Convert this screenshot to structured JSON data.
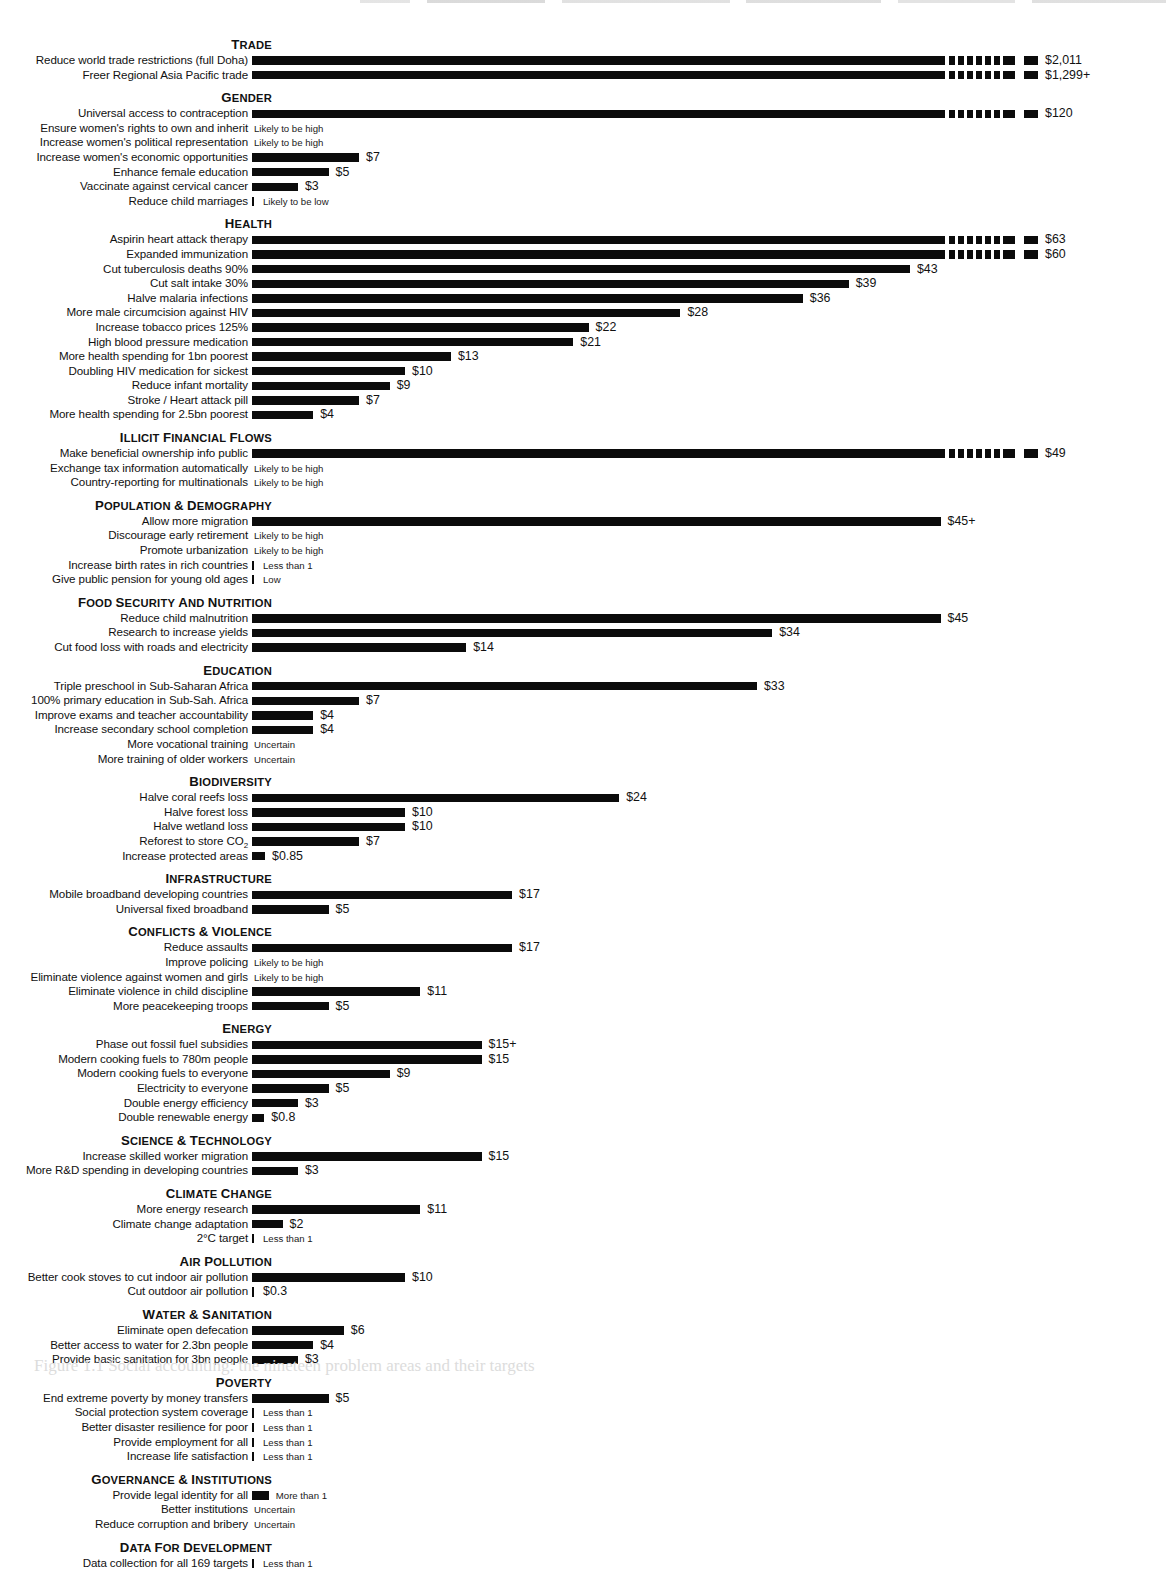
{
  "figure": {
    "caption": "Figure 1.1 Social accounting: the nineteen problem areas and their targets",
    "units_note": "Benefit per dollar spent",
    "axis_origin_px": 252,
    "px_per_dollar": 15.3
  },
  "chart_data": {
    "type": "bar",
    "title": "",
    "xlabel": "",
    "ylabel": "",
    "orientation": "horizontal",
    "grid": false,
    "legend": false,
    "xlim": [
      0,
      55
    ],
    "value_prefix": "$",
    "note_values": [
      "Likely to be high",
      "Likely to be low",
      "Less than 1",
      "More than 1",
      "Low",
      "Uncertain"
    ],
    "sections": [
      {
        "name": "Trade",
        "items": [
          {
            "label": "Reduce world trade restrictions (full Doha)",
            "value": 2011,
            "display": "$2,011",
            "truncated": true
          },
          {
            "label": "Freer Regional Asia Pacific trade",
            "value": 1299,
            "display": "$1,299+",
            "truncated": true
          }
        ]
      },
      {
        "name": "Gender",
        "items": [
          {
            "label": "Universal access to contraception",
            "value": 120,
            "display": "$120",
            "truncated": true
          },
          {
            "label": "Ensure women's rights to own and inherit",
            "value": null,
            "note": "Likely to be high"
          },
          {
            "label": "Increase women's political representation",
            "value": null,
            "note": "Likely to be high"
          },
          {
            "label": "Increase women's economic opportunities",
            "value": 7,
            "display": "$7"
          },
          {
            "label": "Enhance female education",
            "value": 5,
            "display": "$5"
          },
          {
            "label": "Vaccinate against cervical cancer",
            "value": 3,
            "display": "$3"
          },
          {
            "label": "Reduce child marriages",
            "value": 0,
            "note": "Likely to be low",
            "tick": true
          }
        ]
      },
      {
        "name": "Health",
        "items": [
          {
            "label": "Aspirin heart attack therapy",
            "value": 63,
            "display": "$63",
            "truncated": true
          },
          {
            "label": "Expanded immunization",
            "value": 60,
            "display": "$60",
            "truncated": true
          },
          {
            "label": "Cut tuberculosis deaths 90%",
            "value": 43,
            "display": "$43"
          },
          {
            "label": "Cut salt intake 30%",
            "value": 39,
            "display": "$39"
          },
          {
            "label": "Halve malaria infections",
            "value": 36,
            "display": "$36"
          },
          {
            "label": "More male circumcision against HIV",
            "value": 28,
            "display": "$28"
          },
          {
            "label": "Increase tobacco prices 125%",
            "value": 22,
            "display": "$22"
          },
          {
            "label": "High blood pressure medication",
            "value": 21,
            "display": "$21"
          },
          {
            "label": "More health spending for 1bn poorest",
            "value": 13,
            "display": "$13"
          },
          {
            "label": "Doubling HIV medication for sickest",
            "value": 10,
            "display": "$10"
          },
          {
            "label": "Reduce infant mortality",
            "value": 9,
            "display": "$9"
          },
          {
            "label": "Stroke / Heart attack pill",
            "value": 7,
            "display": "$7"
          },
          {
            "label": "More health spending for 2.5bn poorest",
            "value": 4,
            "display": "$4"
          }
        ]
      },
      {
        "name": "Illicit financial flows",
        "items": [
          {
            "label": "Make beneficial ownership info public",
            "value": 49,
            "display": "$49"
          },
          {
            "label": "Exchange tax information automatically",
            "value": null,
            "note": "Likely to be high"
          },
          {
            "label": "Country-reporting for multinationals",
            "value": null,
            "note": "Likely to be high"
          }
        ]
      },
      {
        "name": "Population & Demography",
        "items": [
          {
            "label": "Allow more migration",
            "value": 45,
            "display": "$45+"
          },
          {
            "label": "Discourage early retirement",
            "value": null,
            "note": "Likely to be high"
          },
          {
            "label": "Promote urbanization",
            "value": null,
            "note": "Likely to be high"
          },
          {
            "label": "Increase birth rates in rich countries",
            "value": 0,
            "note": "Less than 1",
            "tick": true
          },
          {
            "label": "Give public pension for young old ages",
            "value": 0,
            "note": "Low",
            "tick": true
          }
        ]
      },
      {
        "name": "Food Security and Nutrition",
        "items": [
          {
            "label": "Reduce child malnutrition",
            "value": 45,
            "display": "$45"
          },
          {
            "label": "Research to increase yields",
            "value": 34,
            "display": "$34"
          },
          {
            "label": "Cut food loss with roads and electricity",
            "value": 14,
            "display": "$14"
          }
        ]
      },
      {
        "name": "Education",
        "items": [
          {
            "label": "Triple preschool in Sub-Saharan Africa",
            "value": 33,
            "display": "$33"
          },
          {
            "label": "100% primary education in Sub-Sah. Africa",
            "value": 7,
            "display": "$7"
          },
          {
            "label": "Improve exams and teacher accountability",
            "value": 4,
            "display": "$4"
          },
          {
            "label": "Increase secondary school completion",
            "value": 4,
            "display": "$4"
          },
          {
            "label": "More vocational training",
            "value": null,
            "note": "Uncertain"
          },
          {
            "label": "More training of older workers",
            "value": null,
            "note": "Uncertain"
          }
        ]
      },
      {
        "name": "Biodiversity",
        "items": [
          {
            "label": "Halve coral reefs loss",
            "value": 24,
            "display": "$24"
          },
          {
            "label": "Halve forest loss",
            "value": 10,
            "display": "$10"
          },
          {
            "label": "Halve wetland loss",
            "value": 10,
            "display": "$10"
          },
          {
            "label": "Reforest to store CO2",
            "label_html": "Reforest to store CO<sub>2</sub>",
            "value": 7,
            "display": "$7"
          },
          {
            "label": "Increase protected areas",
            "value": 0.85,
            "display": "$0.85"
          }
        ]
      },
      {
        "name": "Infrastructure",
        "items": [
          {
            "label": "Mobile broadband developing countries",
            "value": 17,
            "display": "$17"
          },
          {
            "label": "Universal fixed broadband",
            "value": 5,
            "display": "$5"
          }
        ]
      },
      {
        "name": "Conflicts & Violence",
        "items": [
          {
            "label": "Reduce assaults",
            "value": 17,
            "display": "$17"
          },
          {
            "label": "Improve policing",
            "value": null,
            "note": "Likely to be high"
          },
          {
            "label": "Eliminate violence against women and girls",
            "value": null,
            "note": "Likely to be high"
          },
          {
            "label": "Eliminate violence in child discipline",
            "value": 11,
            "display": "$11"
          },
          {
            "label": "More peacekeeping troops",
            "value": 5,
            "display": "$5"
          }
        ]
      },
      {
        "name": "Energy",
        "items": [
          {
            "label": "Phase out fossil fuel subsidies",
            "value": 15,
            "display": "$15+"
          },
          {
            "label": "Modern cooking fuels to 780m people",
            "value": 15,
            "display": "$15"
          },
          {
            "label": "Modern cooking fuels to everyone",
            "value": 9,
            "display": "$9"
          },
          {
            "label": "Electricity to everyone",
            "value": 5,
            "display": "$5"
          },
          {
            "label": "Double energy efficiency",
            "value": 3,
            "display": "$3"
          },
          {
            "label": "Double renewable energy",
            "value": 0.8,
            "display": "$0.8"
          }
        ]
      },
      {
        "name": "Science & technology",
        "items": [
          {
            "label": "Increase skilled worker migration",
            "value": 15,
            "display": "$15"
          },
          {
            "label": "More R&D spending in developing countries",
            "value": 3,
            "display": "$3"
          }
        ]
      },
      {
        "name": "Climate Change",
        "items": [
          {
            "label": "More energy research",
            "value": 11,
            "display": "$11"
          },
          {
            "label": "Climate change adaptation",
            "value": 2,
            "display": "$2"
          },
          {
            "label": "2°C target",
            "value": 0,
            "note": "Less than 1",
            "tick": true
          }
        ]
      },
      {
        "name": "Air Pollution",
        "items": [
          {
            "label": "Better cook stoves to cut indoor air pollution",
            "value": 10,
            "display": "$10"
          },
          {
            "label": "Cut outdoor air pollution",
            "value": 0.3,
            "display": "$0.3",
            "tick": true
          }
        ]
      },
      {
        "name": "Water & Sanitation",
        "items": [
          {
            "label": "Eliminate open defecation",
            "value": 6,
            "display": "$6"
          },
          {
            "label": "Better access to water for 2.3bn people",
            "value": 4,
            "display": "$4"
          },
          {
            "label": "Provide basic sanitation for 3bn people",
            "value": 3,
            "display": "$3"
          }
        ]
      },
      {
        "name": "Poverty",
        "items": [
          {
            "label": "End extreme poverty by money transfers",
            "value": 5,
            "display": "$5"
          },
          {
            "label": "Social protection system coverage",
            "value": 0,
            "note": "Less than 1",
            "tick": true
          },
          {
            "label": "Better disaster resilience for poor",
            "value": 0,
            "note": "Less than 1",
            "tick": true
          },
          {
            "label": "Provide employment for all",
            "value": 0,
            "note": "Less than 1",
            "tick": true
          },
          {
            "label": "Increase life satisfaction",
            "value": 0,
            "note": "Less than 1",
            "tick": true
          }
        ]
      },
      {
        "name": "Governance & Institutions",
        "items": [
          {
            "label": "Provide legal identity for all",
            "value": 1.1,
            "note": "More than 1"
          },
          {
            "label": "Better institutions",
            "value": null,
            "note": "Uncertain"
          },
          {
            "label": "Reduce corruption and bribery",
            "value": null,
            "note": "Uncertain"
          }
        ]
      },
      {
        "name": "Data for Development",
        "items": [
          {
            "label": "Data collection for all 169 targets",
            "value": 0,
            "note": "Less than 1",
            "tick": true
          }
        ]
      }
    ]
  }
}
